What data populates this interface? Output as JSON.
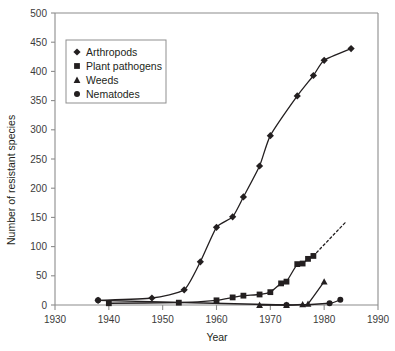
{
  "chart_data": {
    "type": "line",
    "title": "",
    "xlabel": "Year",
    "ylabel": "Number of resistant species",
    "xlim": [
      1930,
      1990
    ],
    "ylim": [
      0,
      500
    ],
    "xticks": [
      1930,
      1940,
      1950,
      1960,
      1970,
      1980,
      1990
    ],
    "yticks": [
      0,
      50,
      100,
      150,
      200,
      250,
      300,
      350,
      400,
      450,
      500
    ],
    "grid": false,
    "legend_position": "upper-left-inside",
    "series": [
      {
        "name": "Arthropods",
        "marker": "diamond",
        "color": "#231f20",
        "linestyle": "solid",
        "x": [
          1938,
          1948,
          1954,
          1957,
          1960,
          1963,
          1965,
          1968,
          1970,
          1975,
          1978,
          1980,
          1985
        ],
        "y": [
          8,
          12,
          26,
          74,
          133,
          151,
          185,
          238,
          290,
          358,
          393,
          419,
          439
        ]
      },
      {
        "name": "Plant pathogens",
        "marker": "square",
        "color": "#231f20",
        "linestyle": "solid",
        "x": [
          1940,
          1953,
          1960,
          1963,
          1965,
          1968,
          1970,
          1972,
          1973,
          1975,
          1976,
          1977,
          1978
        ],
        "y": [
          3,
          4,
          8,
          13,
          16,
          18,
          22,
          37,
          40,
          70,
          71,
          79,
          84
        ],
        "extrapolation": {
          "linestyle": "dashed",
          "x": [
            1978,
            1984
          ],
          "y": [
            84,
            142
          ]
        }
      },
      {
        "name": "Weeds",
        "marker": "triangle",
        "color": "#231f20",
        "linestyle": "solid",
        "x": [
          1968,
          1973,
          1976,
          1977,
          1980
        ],
        "y": [
          0,
          0,
          1,
          2,
          40
        ]
      },
      {
        "name": "Nematodes",
        "marker": "circle",
        "color": "#231f20",
        "linestyle": "solid",
        "x": [
          1938,
          1973,
          1981,
          1983
        ],
        "y": [
          8,
          0,
          3,
          9
        ]
      }
    ]
  },
  "axes": {
    "x_title": "Year",
    "y_title": "Number of resistant species",
    "x_tick_labels": [
      "1930",
      "1940",
      "1950",
      "1960",
      "1970",
      "1980",
      "1990"
    ],
    "y_tick_labels": [
      "0",
      "50",
      "100",
      "150",
      "200",
      "250",
      "300",
      "350",
      "400",
      "450",
      "500"
    ]
  },
  "legend": {
    "items": [
      {
        "label": "Arthropods",
        "marker": "diamond"
      },
      {
        "label": "Plant pathogens",
        "marker": "square"
      },
      {
        "label": "Weeds",
        "marker": "triangle"
      },
      {
        "label": "Nematodes",
        "marker": "circle"
      }
    ]
  },
  "colors": {
    "ink": "#231f20",
    "axis": "#8c8c8c",
    "legend_border": "#8f8f8f",
    "background": "#ffffff"
  }
}
